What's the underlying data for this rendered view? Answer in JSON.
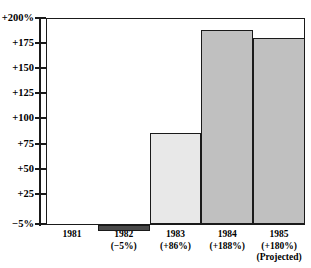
{
  "clipped_caption": "",
  "chart_data": {
    "type": "bar",
    "title": "",
    "subtitle": "",
    "xlabel": "",
    "ylabel": "",
    "categories": [
      "1981",
      "1982",
      "1983",
      "1984",
      "1985"
    ],
    "values": [
      0,
      -5,
      86,
      188,
      180
    ],
    "point_labels": [
      "",
      "(−5%)",
      "(+86%)",
      "(+188%)",
      "(+180%)"
    ],
    "annotations": [
      "",
      "",
      "",
      "",
      "(Projected)"
    ],
    "ylim": [
      -5,
      200
    ],
    "yticks": [
      -5,
      25,
      50,
      75,
      100,
      125,
      150,
      175,
      200
    ],
    "ytick_labels": [
      "−5%",
      "+25",
      "+50",
      "+75",
      "+100",
      "+125",
      "+150",
      "+175",
      "+200%"
    ],
    "grid": false,
    "legend": false,
    "bar_colors": [
      "#ffffff",
      "#4a4a4a",
      "#e8e8e8",
      "#c0c0c0",
      "#c0c0c0"
    ],
    "bar_edge_color": "#1a1a1a",
    "series": [
      {
        "name": "percent change",
        "values": [
          0,
          -5,
          86,
          188,
          180
        ]
      }
    ]
  },
  "axis": {
    "line_color": "#1a1a1a"
  }
}
